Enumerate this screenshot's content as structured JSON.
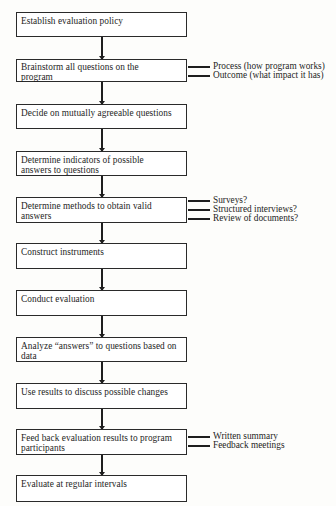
{
  "diagram": {
    "type": "vertical-flowchart",
    "steps": [
      {
        "label": "Establish evaluation policy"
      },
      {
        "label": "Brainstorm all questions on the program"
      },
      {
        "label": "Decide on mutually agreeable questions"
      },
      {
        "label": "Determine indicators of possible answers to questions"
      },
      {
        "label": "Determine methods to obtain valid answers"
      },
      {
        "label": "Construct instruments"
      },
      {
        "label": "Conduct evaluation"
      },
      {
        "label": "Analyze “answers” to questions based on data"
      },
      {
        "label": "Use results to discuss possible changes"
      },
      {
        "label": "Feed back evaluation results to program participants"
      },
      {
        "label": "Evaluate at regular intervals"
      }
    ],
    "branches": {
      "brainstorm": [
        "Process (how program works)",
        "Outcome (what impact it has)"
      ],
      "methods": [
        "Surveys?",
        "Structured interviews?",
        "Review of documents?"
      ],
      "feedback": [
        "Written summary",
        "Feedback meetings"
      ]
    }
  }
}
